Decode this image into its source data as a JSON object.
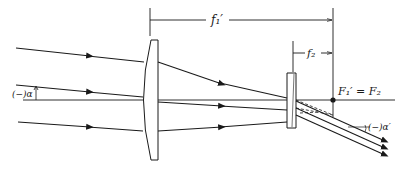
{
  "diagram": {
    "type": "optical-ray-diagram",
    "labels": {
      "f1_prime": "f₁′",
      "f2": "f₂",
      "focal_point": "F₁′ = F₂",
      "angle_in": "(−)α",
      "angle_out": "(−)α′"
    },
    "elements": [
      {
        "id": "converging-lens",
        "kind": "plano-convex lens"
      },
      {
        "id": "diverging-lens",
        "kind": "plano-concave lens"
      },
      {
        "id": "optical-axis",
        "kind": "line"
      },
      {
        "id": "focal-point",
        "kind": "point",
        "label": "F₁′ = F₂"
      }
    ],
    "rays": {
      "incoming_count": 3,
      "outgoing_count": 3
    },
    "colors": {
      "ink": "#1a1a1a",
      "background": "#ffffff"
    }
  }
}
